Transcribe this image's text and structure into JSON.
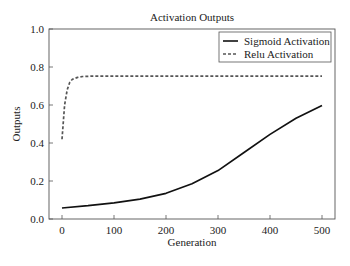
{
  "chart_data": {
    "type": "line",
    "title": "Activation Outputs",
    "xlabel": "Generation",
    "ylabel": "Outputs",
    "xlim": [
      -12,
      525
    ],
    "ylim": [
      0.0,
      1.0
    ],
    "x_ticks": [
      0,
      100,
      200,
      300,
      400,
      500
    ],
    "y_ticks": [
      0.0,
      0.2,
      0.4,
      0.6,
      0.8,
      1.0
    ],
    "y_tick_labels": [
      "0.0",
      "0.2",
      "0.4",
      "0.6",
      "0.8",
      "1.0"
    ],
    "grid": false,
    "legend_position": "upper right",
    "series": [
      {
        "name": "Sigmoid Activation",
        "style": "solid",
        "color": "#111111",
        "x": [
          0,
          50,
          100,
          150,
          200,
          250,
          300,
          350,
          400,
          450,
          500
        ],
        "values": [
          0.058,
          0.07,
          0.085,
          0.105,
          0.135,
          0.185,
          0.255,
          0.35,
          0.445,
          0.53,
          0.598
        ]
      },
      {
        "name": "Relu Activation",
        "style": "dashed",
        "color": "#555555",
        "x": [
          0,
          5,
          10,
          15,
          20,
          30,
          40,
          60,
          100,
          200,
          300,
          400,
          500
        ],
        "values": [
          0.42,
          0.6,
          0.68,
          0.72,
          0.735,
          0.745,
          0.75,
          0.752,
          0.752,
          0.752,
          0.752,
          0.752,
          0.752
        ]
      }
    ]
  }
}
